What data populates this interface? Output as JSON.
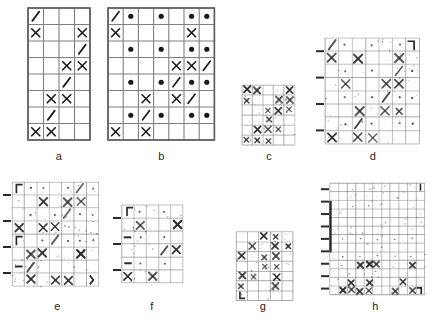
{
  "figure": {
    "background": "#ffffff",
    "grid_color": "#808080",
    "symbol_color": "#1a1a1a",
    "degraded_color": "#2b2b2b"
  },
  "panels": [
    {
      "id": "a",
      "label": "a",
      "kind": "clean",
      "cols": 4,
      "rows": 8,
      "x": 28,
      "y": 8,
      "cell_w": 15.5,
      "cell_h": 16.5,
      "label_x": 28,
      "label_y": 150,
      "label_w": 62,
      "cells": [
        [
          "/",
          "",
          "",
          ""
        ],
        [
          "X",
          "",
          "",
          "X"
        ],
        [
          "",
          "",
          "",
          "/"
        ],
        [
          "",
          "",
          "X",
          "X"
        ],
        [
          "",
          "",
          "/",
          ""
        ],
        [
          "",
          "X",
          "X",
          ""
        ],
        [
          "",
          "/",
          "",
          ""
        ],
        [
          "X",
          "X",
          "",
          ""
        ]
      ]
    },
    {
      "id": "b",
      "label": "b",
      "kind": "clean",
      "cols": 7,
      "rows": 8,
      "x": 108,
      "y": 8,
      "cell_w": 15.2,
      "cell_h": 16.5,
      "label_x": 108,
      "label_y": 150,
      "label_w": 107,
      "cells": [
        [
          "/",
          "o",
          "",
          "o",
          "",
          "o",
          "o"
        ],
        [
          "X",
          "",
          "",
          "",
          "",
          "X",
          ""
        ],
        [
          "",
          "o",
          "",
          "o",
          "",
          "o",
          "o"
        ],
        [
          "",
          "",
          "",
          "",
          "X",
          "X",
          ""
        ],
        [
          "",
          "o",
          "",
          "o",
          "/",
          "o",
          "o"
        ],
        [
          "",
          "",
          "X",
          "",
          "X",
          "",
          ""
        ],
        [
          "",
          "o",
          "/",
          "o",
          "",
          "o",
          "o"
        ],
        [
          "X",
          "",
          "X",
          "",
          "",
          "",
          ""
        ]
      ],
      "overlay_slashes": [
        {
          "row": 3,
          "col": 6
        },
        {
          "row": 5,
          "col": 5
        }
      ]
    },
    {
      "id": "c",
      "label": "c",
      "kind": "degraded",
      "cols": 5,
      "rows": 6,
      "x": 242,
      "y": 85,
      "cell_w": 10.5,
      "cell_h": 10.0,
      "label_x": 238,
      "label_y": 150,
      "label_w": 62,
      "noise": 0.55,
      "marks": [
        {
          "row": 0,
          "col": 0,
          "sym": "X"
        },
        {
          "row": 0,
          "col": 1,
          "sym": "X"
        },
        {
          "row": 0,
          "col": 4,
          "sym": "X"
        },
        {
          "row": 1,
          "col": 0,
          "sym": "x"
        },
        {
          "row": 1,
          "col": 3,
          "sym": "X"
        },
        {
          "row": 1,
          "col": 4,
          "sym": "X"
        },
        {
          "row": 2,
          "col": 2,
          "sym": "x"
        },
        {
          "row": 2,
          "col": 3,
          "sym": "X"
        },
        {
          "row": 2,
          "col": 4,
          "sym": "x"
        },
        {
          "row": 3,
          "col": 2,
          "sym": "x"
        },
        {
          "row": 4,
          "col": 1,
          "sym": "X"
        },
        {
          "row": 4,
          "col": 2,
          "sym": "X"
        },
        {
          "row": 4,
          "col": 3,
          "sym": "x"
        },
        {
          "row": 5,
          "col": 0,
          "sym": "x"
        },
        {
          "row": 5,
          "col": 1,
          "sym": "x"
        },
        {
          "row": 5,
          "col": 2,
          "sym": "x"
        }
      ]
    },
    {
      "id": "d",
      "label": "d",
      "kind": "degraded",
      "cols": 7,
      "rows": 8,
      "x": 325,
      "y": 38,
      "cell_w": 13.5,
      "cell_h": 13.2,
      "label_x": 318,
      "label_y": 150,
      "label_w": 110,
      "noise": 0.5,
      "ticks_left": 4,
      "marks": [
        {
          "row": 0,
          "col": 0,
          "sym": "/"
        },
        {
          "row": 0,
          "col": 1,
          "sym": "."
        },
        {
          "row": 0,
          "col": 3,
          "sym": "."
        },
        {
          "row": 0,
          "col": 5,
          "sym": "."
        },
        {
          "row": 0,
          "col": 6,
          "sym": "]"
        },
        {
          "row": 1,
          "col": 0,
          "sym": "X"
        },
        {
          "row": 1,
          "col": 2,
          "sym": "X"
        },
        {
          "row": 1,
          "col": 5,
          "sym": "X"
        },
        {
          "row": 2,
          "col": 1,
          "sym": "."
        },
        {
          "row": 2,
          "col": 3,
          "sym": "."
        },
        {
          "row": 2,
          "col": 5,
          "sym": "/"
        },
        {
          "row": 2,
          "col": 6,
          "sym": "."
        },
        {
          "row": 3,
          "col": 1,
          "sym": "X"
        },
        {
          "row": 3,
          "col": 4,
          "sym": "X"
        },
        {
          "row": 3,
          "col": 5,
          "sym": "X"
        },
        {
          "row": 4,
          "col": 1,
          "sym": "."
        },
        {
          "row": 4,
          "col": 3,
          "sym": "."
        },
        {
          "row": 4,
          "col": 4,
          "sym": "/"
        },
        {
          "row": 4,
          "col": 5,
          "sym": "."
        },
        {
          "row": 4,
          "col": 6,
          "sym": "."
        },
        {
          "row": 5,
          "col": 2,
          "sym": "X"
        },
        {
          "row": 5,
          "col": 4,
          "sym": "X"
        },
        {
          "row": 5,
          "col": 5,
          "sym": "x"
        },
        {
          "row": 6,
          "col": 1,
          "sym": "."
        },
        {
          "row": 6,
          "col": 2,
          "sym": "/"
        },
        {
          "row": 6,
          "col": 3,
          "sym": "."
        },
        {
          "row": 6,
          "col": 5,
          "sym": "."
        },
        {
          "row": 6,
          "col": 6,
          "sym": "."
        },
        {
          "row": 7,
          "col": 0,
          "sym": "X"
        },
        {
          "row": 7,
          "col": 2,
          "sym": "X"
        },
        {
          "row": 7,
          "col": 3,
          "sym": "X"
        }
      ]
    },
    {
      "id": "e",
      "label": "e",
      "kind": "degraded",
      "cols": 7,
      "rows": 8,
      "x": 12,
      "y": 182,
      "cell_w": 12.4,
      "cell_h": 13.0,
      "label_x": 5,
      "label_y": 300,
      "label_w": 105,
      "noise": 0.6,
      "ticks_left": 4,
      "marks": [
        {
          "row": 0,
          "col": 0,
          "sym": "["
        },
        {
          "row": 0,
          "col": 1,
          "sym": "."
        },
        {
          "row": 0,
          "col": 2,
          "sym": "."
        },
        {
          "row": 0,
          "col": 4,
          "sym": "."
        },
        {
          "row": 0,
          "col": 5,
          "sym": "/"
        },
        {
          "row": 0,
          "col": 6,
          "sym": "."
        },
        {
          "row": 1,
          "col": 2,
          "sym": "X"
        },
        {
          "row": 1,
          "col": 4,
          "sym": "X"
        },
        {
          "row": 1,
          "col": 5,
          "sym": "X"
        },
        {
          "row": 2,
          "col": 1,
          "sym": "."
        },
        {
          "row": 2,
          "col": 3,
          "sym": "."
        },
        {
          "row": 2,
          "col": 4,
          "sym": "/"
        },
        {
          "row": 2,
          "col": 5,
          "sym": "."
        },
        {
          "row": 2,
          "col": 6,
          "sym": "."
        },
        {
          "row": 3,
          "col": 0,
          "sym": "X"
        },
        {
          "row": 3,
          "col": 2,
          "sym": "X"
        },
        {
          "row": 3,
          "col": 3,
          "sym": "X"
        },
        {
          "row": 4,
          "col": 0,
          "sym": "["
        },
        {
          "row": 4,
          "col": 2,
          "sym": "."
        },
        {
          "row": 4,
          "col": 3,
          "sym": "/"
        },
        {
          "row": 4,
          "col": 4,
          "sym": "."
        },
        {
          "row": 4,
          "col": 5,
          "sym": "."
        },
        {
          "row": 4,
          "col": 6,
          "sym": "."
        },
        {
          "row": 5,
          "col": 1,
          "sym": "X"
        },
        {
          "row": 5,
          "col": 2,
          "sym": "X"
        },
        {
          "row": 5,
          "col": 5,
          "sym": "X"
        },
        {
          "row": 6,
          "col": 0,
          "sym": "-"
        },
        {
          "row": 6,
          "col": 1,
          "sym": "/"
        },
        {
          "row": 7,
          "col": 1,
          "sym": "X"
        },
        {
          "row": 7,
          "col": 3,
          "sym": "X"
        },
        {
          "row": 7,
          "col": 4,
          "sym": "X"
        },
        {
          "row": 7,
          "col": 6,
          "sym": ")"
        }
      ]
    },
    {
      "id": "f",
      "label": "f",
      "kind": "degraded",
      "cols": 5,
      "rows": 6,
      "x": 122,
      "y": 205,
      "cell_w": 12.2,
      "cell_h": 13.0,
      "label_x": 112,
      "label_y": 300,
      "label_w": 80,
      "noise": 0.55,
      "ticks_left": 3,
      "marks": [
        {
          "row": 0,
          "col": 0,
          "sym": "["
        },
        {
          "row": 0,
          "col": 1,
          "sym": "."
        },
        {
          "row": 0,
          "col": 3,
          "sym": "."
        },
        {
          "row": 1,
          "col": 1,
          "sym": "X"
        },
        {
          "row": 1,
          "col": 4,
          "sym": "X"
        },
        {
          "row": 2,
          "col": 0,
          "sym": "-"
        },
        {
          "row": 2,
          "col": 1,
          "sym": "."
        },
        {
          "row": 2,
          "col": 3,
          "sym": "."
        },
        {
          "row": 3,
          "col": 3,
          "sym": "/"
        },
        {
          "row": 3,
          "col": 4,
          "sym": "X"
        },
        {
          "row": 4,
          "col": 0,
          "sym": "-"
        },
        {
          "row": 4,
          "col": 1,
          "sym": "."
        },
        {
          "row": 4,
          "col": 3,
          "sym": "."
        },
        {
          "row": 5,
          "col": 0,
          "sym": "X"
        },
        {
          "row": 5,
          "col": 2,
          "sym": "X"
        }
      ]
    },
    {
      "id": "g",
      "label": "g",
      "kind": "degraded",
      "cols": 5,
      "rows": 7,
      "x": 236,
      "y": 232,
      "cell_w": 11.4,
      "cell_h": 9.8,
      "label_x": 228,
      "label_y": 300,
      "label_w": 70,
      "noise": 0.6,
      "marks": [
        {
          "row": 0,
          "col": 2,
          "sym": "X"
        },
        {
          "row": 0,
          "col": 3,
          "sym": "x"
        },
        {
          "row": 1,
          "col": 1,
          "sym": "X"
        },
        {
          "row": 1,
          "col": 3,
          "sym": "X"
        },
        {
          "row": 1,
          "col": 4,
          "sym": "x"
        },
        {
          "row": 2,
          "col": 0,
          "sym": "X"
        },
        {
          "row": 2,
          "col": 2,
          "sym": "x"
        },
        {
          "row": 2,
          "col": 3,
          "sym": "X"
        },
        {
          "row": 3,
          "col": 2,
          "sym": "x"
        },
        {
          "row": 3,
          "col": 3,
          "sym": "x"
        },
        {
          "row": 4,
          "col": 0,
          "sym": "X"
        },
        {
          "row": 4,
          "col": 1,
          "sym": "x"
        },
        {
          "row": 4,
          "col": 3,
          "sym": "X"
        },
        {
          "row": 5,
          "col": 0,
          "sym": "x"
        },
        {
          "row": 5,
          "col": 3,
          "sym": "X"
        },
        {
          "row": 6,
          "col": 0,
          "sym": "L"
        }
      ]
    },
    {
      "id": "h",
      "label": "h",
      "kind": "degraded",
      "cols": 11,
      "rows": 13,
      "x": 330,
      "y": 183,
      "cell_w": 8.6,
      "cell_h": 8.6,
      "label_x": 318,
      "label_y": 300,
      "label_w": 115,
      "noise": 0.35,
      "ticks_left": 9,
      "marks": [
        {
          "row": 0,
          "col": 10,
          "sym": "|"
        },
        {
          "row": 6,
          "col": 1,
          "sym": "."
        },
        {
          "row": 6,
          "col": 3,
          "sym": "."
        },
        {
          "row": 6,
          "col": 5,
          "sym": "."
        },
        {
          "row": 6,
          "col": 7,
          "sym": "."
        },
        {
          "row": 6,
          "col": 9,
          "sym": "."
        },
        {
          "row": 8,
          "col": 1,
          "sym": "."
        },
        {
          "row": 8,
          "col": 3,
          "sym": "."
        },
        {
          "row": 8,
          "col": 5,
          "sym": "."
        },
        {
          "row": 8,
          "col": 7,
          "sym": "."
        },
        {
          "row": 8,
          "col": 9,
          "sym": "."
        },
        {
          "row": 9,
          "col": 3,
          "sym": "X"
        },
        {
          "row": 9,
          "col": 4,
          "sym": "X"
        },
        {
          "row": 9,
          "col": 5,
          "sym": "X"
        },
        {
          "row": 9,
          "col": 9,
          "sym": "X"
        },
        {
          "row": 11,
          "col": 2,
          "sym": "X"
        },
        {
          "row": 11,
          "col": 4,
          "sym": "X"
        },
        {
          "row": 11,
          "col": 8,
          "sym": "X"
        },
        {
          "row": 12,
          "col": 1,
          "sym": "X"
        },
        {
          "row": 12,
          "col": 2,
          "sym": "X"
        },
        {
          "row": 12,
          "col": 3,
          "sym": "X"
        },
        {
          "row": 12,
          "col": 4,
          "sym": "X"
        },
        {
          "row": 12,
          "col": 7,
          "sym": "X"
        },
        {
          "row": 12,
          "col": 9,
          "sym": "X"
        },
        {
          "row": 12,
          "col": 10,
          "sym": "]"
        }
      ]
    }
  ]
}
